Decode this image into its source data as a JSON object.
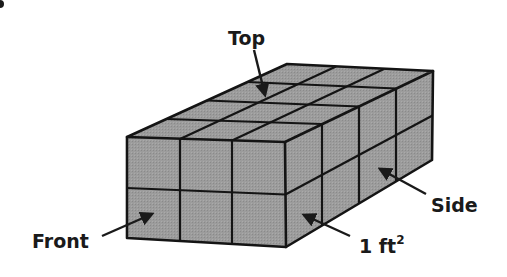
{
  "figure": {
    "type": "rectangular-prism",
    "dimensions": {
      "width_units": 3,
      "height_units": 2,
      "depth_units": 4
    },
    "unit_square": "1 ft²",
    "fill_color": "#9a9a9a",
    "line_color": "#141414",
    "labels": {
      "top": "Top",
      "front": "Front",
      "side": "Side",
      "unit": "1 ft",
      "unit_exponent": "2"
    }
  }
}
